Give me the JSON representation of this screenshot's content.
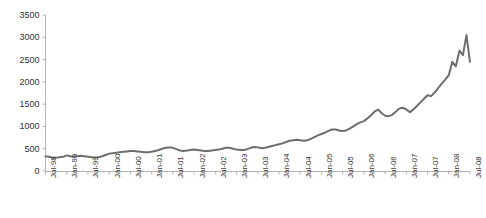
{
  "chart_data": {
    "type": "line",
    "title": "",
    "subtitle": "",
    "xlabel": "",
    "ylabel": "",
    "grid": false,
    "legend": false,
    "legend_position": "none",
    "line_color": "#6e6e6e",
    "axis_color": "#b3b3b3",
    "background_color": "#ffffff",
    "ylim": [
      0,
      3500
    ],
    "yticks": [
      0,
      500,
      1000,
      1500,
      2000,
      2500,
      3000,
      3500
    ],
    "ytick_labels": [
      "0",
      "500",
      "1000",
      "1500",
      "2000",
      "2500",
      "3000",
      "3500"
    ],
    "xlim": [
      "Jul-98",
      "Jul-08"
    ],
    "xtick_labels": [
      "Jul-98",
      "Jan-99",
      "Jul-99",
      "Jan-00",
      "Jul-00",
      "Jan-01",
      "Jul-01",
      "Jan-02",
      "Jul-02",
      "Jan-03",
      "Jul-03",
      "Jan-04",
      "Jul-04",
      "Jan-05",
      "Jul-05",
      "Jan-06",
      "Jul-06",
      "Jan-07",
      "Jul-07",
      "Jan-08",
      "Jul-08"
    ],
    "x_tick_interval_months": 6,
    "series": [
      {
        "name": "Index",
        "x": [
          "Jul-98",
          "Aug-98",
          "Sep-98",
          "Oct-98",
          "Nov-98",
          "Dec-98",
          "Jan-99",
          "Feb-99",
          "Mar-99",
          "Apr-99",
          "May-99",
          "Jun-99",
          "Jul-99",
          "Aug-99",
          "Sep-99",
          "Oct-99",
          "Nov-99",
          "Dec-99",
          "Jan-00",
          "Feb-00",
          "Mar-00",
          "Apr-00",
          "May-00",
          "Jun-00",
          "Jul-00",
          "Aug-00",
          "Sep-00",
          "Oct-00",
          "Nov-00",
          "Dec-00",
          "Jan-01",
          "Feb-01",
          "Mar-01",
          "Apr-01",
          "May-01",
          "Jun-01",
          "Jul-01",
          "Aug-01",
          "Sep-01",
          "Oct-01",
          "Nov-01",
          "Dec-01",
          "Jan-02",
          "Feb-02",
          "Mar-02",
          "Apr-02",
          "May-02",
          "Jun-02",
          "Jul-02",
          "Aug-02",
          "Sep-02",
          "Oct-02",
          "Nov-02",
          "Dec-02",
          "Jan-03",
          "Feb-03",
          "Mar-03",
          "Apr-03",
          "May-03",
          "Jun-03",
          "Jul-03",
          "Aug-03",
          "Sep-03",
          "Oct-03",
          "Nov-03",
          "Dec-03",
          "Jan-04",
          "Feb-04",
          "Mar-04",
          "Apr-04",
          "May-04",
          "Jun-04",
          "Jul-04",
          "Aug-04",
          "Sep-04",
          "Oct-04",
          "Nov-04",
          "Dec-04",
          "Jan-05",
          "Feb-05",
          "Mar-05",
          "Apr-05",
          "May-05",
          "Jun-05",
          "Jul-05",
          "Aug-05",
          "Sep-05",
          "Oct-05",
          "Nov-05",
          "Dec-05",
          "Jan-06",
          "Feb-06",
          "Mar-06",
          "Apr-06",
          "May-06",
          "Jun-06",
          "Jul-06",
          "Aug-06",
          "Sep-06",
          "Oct-06",
          "Nov-06",
          "Dec-06",
          "Jan-07",
          "Feb-07",
          "Mar-07",
          "Apr-07",
          "May-07",
          "Jun-07",
          "Jul-07",
          "Aug-07",
          "Sep-07",
          "Oct-07",
          "Nov-07",
          "Dec-07",
          "Jan-08",
          "Feb-08",
          "Mar-08",
          "Apr-08",
          "May-08",
          "Jun-08",
          "Jul-08"
        ],
        "values": [
          330,
          320,
          300,
          300,
          310,
          320,
          350,
          330,
          320,
          330,
          340,
          330,
          320,
          310,
          300,
          310,
          330,
          360,
          390,
          400,
          410,
          420,
          430,
          440,
          450,
          450,
          440,
          430,
          420,
          420,
          430,
          450,
          470,
          500,
          520,
          530,
          520,
          490,
          460,
          450,
          460,
          470,
          480,
          470,
          460,
          450,
          450,
          460,
          470,
          480,
          500,
          520,
          520,
          500,
          480,
          470,
          470,
          490,
          520,
          540,
          530,
          510,
          520,
          540,
          560,
          580,
          600,
          620,
          650,
          680,
          690,
          700,
          690,
          680,
          690,
          720,
          760,
          800,
          830,
          860,
          900,
          930,
          930,
          910,
          900,
          910,
          950,
          1000,
          1050,
          1090,
          1120,
          1180,
          1250,
          1330,
          1380,
          1300,
          1240,
          1230,
          1260,
          1330,
          1400,
          1420,
          1380,
          1320,
          1380,
          1460,
          1540,
          1620,
          1700,
          1680,
          1760,
          1860,
          1960,
          2050,
          2150,
          2450,
          2350,
          2700,
          2600,
          3050,
          2450
        ]
      }
    ],
    "peak_value": 3050,
    "peak_label": "Jun-08",
    "final_value": 2450,
    "start_value": 330
  }
}
